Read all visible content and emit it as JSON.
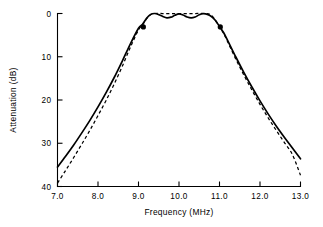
{
  "chart_data": {
    "type": "line",
    "title": "",
    "xlabel": "Frequency   (MHz)",
    "ylabel": "Attenuation   (dB)",
    "xlim": [
      7.0,
      13.0
    ],
    "ylim": [
      40,
      0
    ],
    "y_inverted": true,
    "grid": false,
    "legend": "none",
    "xticks": [
      7.0,
      8.0,
      9.0,
      10.0,
      11.0,
      12.0,
      13.0
    ],
    "xticklabels": [
      "7.0",
      "8.0",
      "9.0",
      "10.0",
      "11.0",
      "12.0",
      "13.0"
    ],
    "yticks": [
      0,
      10,
      20,
      30,
      40
    ],
    "yticklabels": [
      "0",
      "10",
      "20",
      "30",
      "40"
    ],
    "series": [
      {
        "name": "solid-response",
        "style": "solid",
        "color": "#000000",
        "x": [
          7.0,
          7.2,
          7.4,
          7.6,
          7.8,
          8.0,
          8.2,
          8.4,
          8.6,
          8.8,
          9.0,
          9.1,
          9.2,
          9.3,
          9.4,
          9.5,
          9.6,
          9.7,
          9.8,
          9.9,
          10.0,
          10.1,
          10.2,
          10.3,
          10.4,
          10.5,
          10.6,
          10.7,
          10.8,
          10.9,
          11.0,
          11.1,
          11.2,
          11.4,
          11.6,
          11.8,
          12.0,
          12.2,
          12.4,
          12.6,
          12.8,
          13.0
        ],
        "y": [
          35.5,
          33.0,
          30.4,
          27.6,
          24.7,
          21.6,
          18.3,
          14.8,
          11.0,
          7.0,
          3.4,
          2.5,
          1.1,
          0.2,
          0.0,
          0.25,
          0.7,
          1.0,
          0.85,
          0.4,
          0.1,
          0.35,
          0.8,
          1.0,
          0.8,
          0.3,
          0.05,
          0.2,
          0.7,
          1.6,
          3.0,
          4.4,
          6.2,
          10.0,
          13.6,
          17.0,
          20.2,
          23.2,
          26.0,
          28.6,
          31.1,
          33.6
        ]
      },
      {
        "name": "dashed-response",
        "style": "dashed",
        "color": "#000000",
        "x": [
          7.0,
          7.2,
          7.4,
          7.6,
          7.8,
          8.0,
          8.2,
          8.4,
          8.6,
          8.8,
          9.0,
          9.1,
          9.2,
          9.3,
          9.4,
          9.6,
          9.8,
          10.0,
          10.2,
          10.4,
          10.6,
          10.8,
          11.0,
          11.1,
          11.2,
          11.4,
          11.6,
          11.8,
          12.0,
          12.2,
          12.4,
          12.6,
          12.8,
          13.0
        ],
        "y": [
          39.2,
          36.3,
          33.3,
          30.2,
          27.0,
          23.6,
          20.1,
          16.3,
          12.2,
          7.8,
          3.8,
          2.6,
          1.2,
          0.3,
          0.0,
          0.0,
          0.0,
          0.0,
          0.0,
          0.0,
          0.0,
          0.4,
          3.1,
          4.6,
          6.5,
          10.5,
          14.2,
          17.7,
          21.0,
          24.1,
          27.0,
          29.8,
          32.6,
          37.4
        ]
      }
    ],
    "markers": [
      {
        "name": "lower-cutoff-marker",
        "x": 9.12,
        "y": 3.1
      },
      {
        "name": "upper-cutoff-marker",
        "x": 11.02,
        "y": 3.1
      }
    ]
  }
}
